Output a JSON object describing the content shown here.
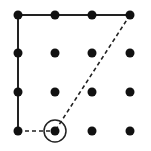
{
  "diagram": {
    "type": "dot-grid-path",
    "grid": {
      "rows": 4,
      "cols": 4
    },
    "colors": {
      "background": "#ffffff",
      "dot": "#111111",
      "line": "#222222"
    },
    "column_x": [
      18,
      55,
      92,
      130
    ],
    "row_y": [
      15,
      53,
      92,
      131
    ],
    "dot_radius": 4.5,
    "solid_path": [
      [
        0,
        3
      ],
      [
        0,
        2
      ],
      [
        0,
        1
      ],
      [
        0,
        0
      ],
      [
        1,
        0
      ],
      [
        2,
        0
      ],
      [
        3,
        0
      ]
    ],
    "dashed_segments": [
      {
        "from": [
          3,
          0
        ],
        "to": [
          1,
          3
        ]
      },
      {
        "from": [
          0,
          3
        ],
        "to": [
          1,
          3
        ]
      }
    ],
    "highlight": {
      "col": 1,
      "row": 3,
      "radius": 11
    }
  }
}
